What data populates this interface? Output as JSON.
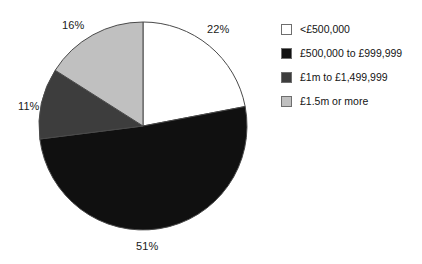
{
  "chart_data": {
    "type": "pie",
    "title": "",
    "subtitle": "",
    "xlabel": "",
    "ylabel": "",
    "grid": false,
    "legend_position": "right",
    "start_angle_deg": 0,
    "direction": "clockwise",
    "categories": [
      "<£500,000",
      "£500,000 to £999,999",
      "£1m to £1,499,999",
      "£1.5m or more"
    ],
    "values": [
      22,
      51,
      11,
      16
    ],
    "data_labels": [
      "22%",
      "51%",
      "11%",
      "16%"
    ],
    "unit": "%",
    "colors": [
      "#ffffff",
      "#101010",
      "#3d3d3d",
      "#c0c0c0"
    ],
    "slice_border_color": "#4a4a4a",
    "annotations": []
  },
  "legend": {
    "items": [
      {
        "label": "<£500,000",
        "color": "#ffffff"
      },
      {
        "label": "£500,000 to £999,999",
        "color": "#101010"
      },
      {
        "label": "£1m to £1,499,999",
        "color": "#3d3d3d"
      },
      {
        "label": "£1.5m or more",
        "color": "#c0c0c0"
      }
    ]
  },
  "geometry": {
    "center_x": 143,
    "center_y": 126,
    "radius": 104
  }
}
